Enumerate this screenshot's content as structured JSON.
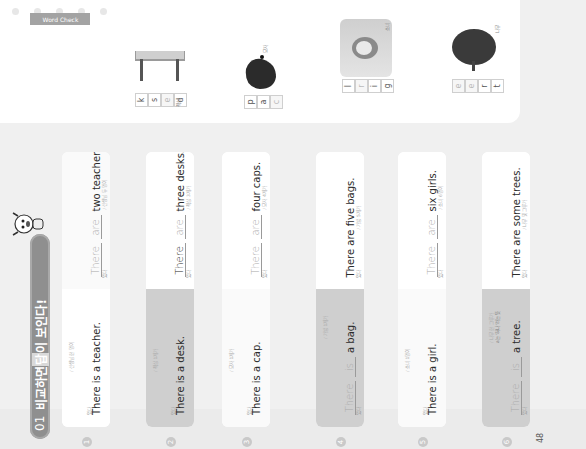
{
  "title": {
    "number": "01",
    "text_pre": "비교하면 ",
    "text_highlight": "답",
    "text_post": "이 보인다!"
  },
  "word_check": {
    "label": "Word Check",
    "items": [
      {
        "word": "desk",
        "ko": "책상",
        "letters": [
          {
            "ch": "d",
            "hint": false
          },
          {
            "ch": "e",
            "hint": true
          },
          {
            "ch": "s",
            "hint": false
          },
          {
            "ch": "k",
            "hint": false
          }
        ]
      },
      {
        "word": "cap",
        "ko": "모자",
        "letters": [
          {
            "ch": "c",
            "hint": true
          },
          {
            "ch": "a",
            "hint": false
          },
          {
            "ch": "p",
            "hint": false
          }
        ]
      },
      {
        "word": "girl",
        "ko": "소녀",
        "letters": [
          {
            "ch": "g",
            "hint": false
          },
          {
            "ch": "i",
            "hint": false
          },
          {
            "ch": "r",
            "hint": true
          },
          {
            "ch": "l",
            "hint": false
          }
        ]
      },
      {
        "word": "tree",
        "ko": "나무",
        "letters": [
          {
            "ch": "t",
            "hint": false
          },
          {
            "ch": "r",
            "hint": false
          },
          {
            "ch": "e",
            "hint": true
          },
          {
            "ch": "e",
            "hint": true
          }
        ]
      }
    ]
  },
  "cards": [
    {
      "number": "1",
      "top": {
        "label": "있다",
        "gloss": "/ 선생님 한 명이",
        "sentence": "There is a teacher."
      },
      "bottom": {
        "label": "있다",
        "word1": "There",
        "word2": "are",
        "rest": "two teachers.",
        "gloss": "/ 선생님 두 명이",
        "word1_dark": false
      }
    },
    {
      "number": "2",
      "top": {
        "label": "있다",
        "gloss": "/ 책상 1개가",
        "sentence": "There is a desk."
      },
      "bottom": {
        "label": "있다",
        "word1": "There",
        "word2": "are",
        "rest": "three desks.",
        "gloss": "/ 책상 3개가",
        "word1_dark": true
      }
    },
    {
      "number": "3",
      "top": {
        "label": "있다",
        "gloss": "/ 모자 1개가",
        "sentence": "There is a cap."
      },
      "bottom": {
        "label": "있다",
        "word1": "There",
        "word2": "are",
        "rest": "four caps.",
        "gloss": "/ 모자 4개가",
        "word1_dark": false
      }
    },
    {
      "number": "4",
      "top": {
        "label": "있다",
        "word1": "There",
        "word2": "is",
        "rest": "a bag.",
        "gloss": "/ 가방 1개가"
      },
      "bottom": {
        "label": "있다",
        "gloss": "/ 가방 5개가",
        "sentence": "There are five bags."
      }
    },
    {
      "number": "5",
      "top": {
        "label": "있다",
        "gloss": "/ 소녀 1명이",
        "sentence": "There is a girl."
      },
      "bottom": {
        "label": "있다",
        "word1": "There",
        "word2": "are",
        "rest": "six girls.",
        "gloss": "/ 소녀 6명이",
        "word1_dark": false
      }
    },
    {
      "number": "6",
      "top": {
        "label": "있다",
        "word1": "There",
        "word2": "is",
        "rest": "a tree.",
        "gloss": "/ 나무 한 그루가",
        "note": "a는 '하나'라는 뜻"
      },
      "bottom": {
        "label": "있다",
        "gloss": "/ 나무 몇 그루가",
        "sentence": "There are some trees."
      }
    }
  ],
  "page_number": "48"
}
